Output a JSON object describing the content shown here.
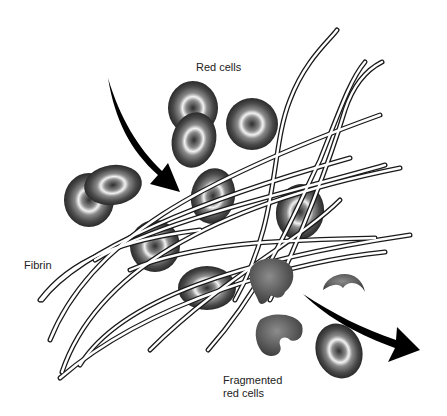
{
  "diagram": {
    "labels": {
      "red_cells": "Red cells",
      "fibrin": "Fibrin",
      "fragmented_line1": "Fragmented",
      "fragmented_line2": "red cells"
    },
    "elements": {
      "red_cells_count": 10,
      "fragmented_cells_count": 4,
      "fibrin_strands_count": 12,
      "arrows": [
        "incoming-flow-arrow",
        "outgoing-flow-arrow"
      ]
    },
    "colors": {
      "cell_dark": "#2a2a2a",
      "cell_mid": "#6b6b6b",
      "cell_highlight": "#eeeeee",
      "fragment": "#5a5a5a",
      "arrow": "#000000",
      "fibrin_outline": "#1a1a1a",
      "fibrin_fill": "#ffffff"
    }
  }
}
